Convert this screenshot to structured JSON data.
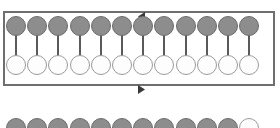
{
  "figure": {
    "title": "Array of coupled pendulum units inside a circulating loop",
    "background_color": "#ffffff",
    "width": 280,
    "height": 128
  },
  "frame": {
    "label": "circulation-loop-frame",
    "x": 3,
    "y": 11,
    "width": 272,
    "height": 75,
    "border_color": "#6e6e6e",
    "border_width": 2
  },
  "arrows": [
    {
      "name": "top-rail-arrow",
      "direction": "left",
      "symbol": "◂",
      "x": 138,
      "y": 12,
      "color": "#3a3a3a"
    },
    {
      "name": "bottom-rail-arrow",
      "direction": "right",
      "symbol": "▸",
      "x": 138,
      "y": 85,
      "color": "#3a3a3a"
    }
  ],
  "geometry": {
    "bob_diameter": 20,
    "ring_diameter": 20,
    "stem_width": 2,
    "column_pitch": 21.2,
    "first_column_x": 6
  },
  "colors": {
    "bob_fill": "#8d8d8d",
    "bob_stroke": "#6b6b6b",
    "ring_fill": "#fdfdfd",
    "ring_stroke": "#9a9a9a",
    "stem": "#5a5a5a",
    "frame": "#6e6e6e",
    "arrow": "#3a3a3a"
  },
  "groups": [
    {
      "name": "upper-array",
      "caption": "Upper array: 12 pendulum units enclosed by the loop",
      "enclosed": true,
      "bob_row_y": 16,
      "ring_row_y": 55,
      "stem_top": 34,
      "stem_height": 22,
      "count": 12,
      "units": [
        {
          "index": 1,
          "bob_state": "filled",
          "ring_state": "open"
        },
        {
          "index": 2,
          "bob_state": "filled",
          "ring_state": "open"
        },
        {
          "index": 3,
          "bob_state": "filled",
          "ring_state": "open"
        },
        {
          "index": 4,
          "bob_state": "filled",
          "ring_state": "open"
        },
        {
          "index": 5,
          "bob_state": "filled",
          "ring_state": "open"
        },
        {
          "index": 6,
          "bob_state": "filled",
          "ring_state": "open"
        },
        {
          "index": 7,
          "bob_state": "filled",
          "ring_state": "open"
        },
        {
          "index": 8,
          "bob_state": "filled",
          "ring_state": "open"
        },
        {
          "index": 9,
          "bob_state": "filled",
          "ring_state": "open"
        },
        {
          "index": 10,
          "bob_state": "filled",
          "ring_state": "open"
        },
        {
          "index": 11,
          "bob_state": "filled",
          "ring_state": "open"
        },
        {
          "index": 12,
          "bob_state": "filled",
          "ring_state": "open"
        }
      ]
    },
    {
      "name": "lower-array-partial",
      "caption": "Lower array (clipped by image edge): 11 filled bobs followed by 1 open ring",
      "enclosed": false,
      "bob_row_y": 118,
      "count": 12,
      "units": [
        {
          "index": 1,
          "bob_state": "filled"
        },
        {
          "index": 2,
          "bob_state": "filled"
        },
        {
          "index": 3,
          "bob_state": "filled"
        },
        {
          "index": 4,
          "bob_state": "filled"
        },
        {
          "index": 5,
          "bob_state": "filled"
        },
        {
          "index": 6,
          "bob_state": "filled"
        },
        {
          "index": 7,
          "bob_state": "filled"
        },
        {
          "index": 8,
          "bob_state": "filled"
        },
        {
          "index": 9,
          "bob_state": "filled"
        },
        {
          "index": 10,
          "bob_state": "filled"
        },
        {
          "index": 11,
          "bob_state": "filled"
        },
        {
          "index": 12,
          "bob_state": "open"
        }
      ]
    }
  ]
}
